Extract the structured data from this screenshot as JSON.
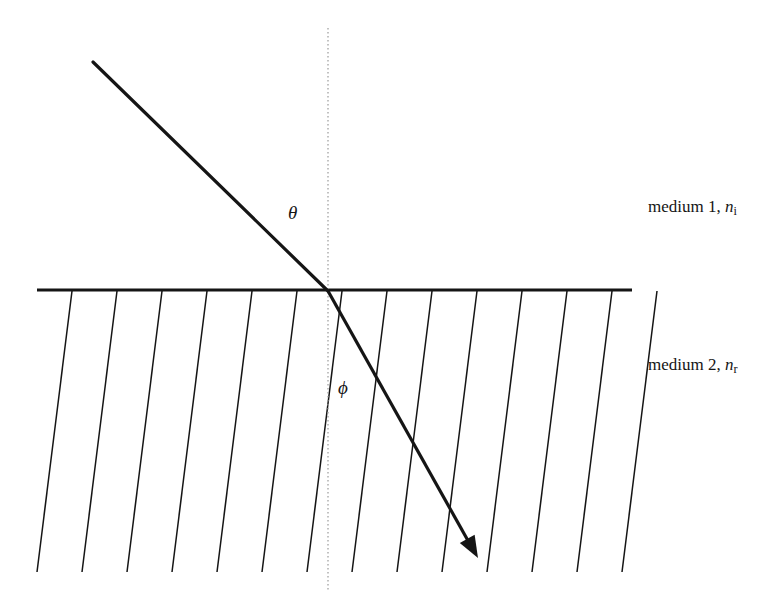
{
  "figure": {
    "kind": "optics-refraction-diagram",
    "background_color": "#ffffff",
    "stroke_color": "#151515",
    "width": 778,
    "height": 614
  },
  "labels": {
    "medium1": {
      "text": "medium 1, ",
      "symbol": "n",
      "subscript": "i",
      "full_text": "medium 1, n_i",
      "x": 648,
      "y": 198
    },
    "medium2": {
      "text": "medium 2, ",
      "symbol": "n",
      "subscript": "r",
      "full_text": "medium 2, n_r",
      "x": 648,
      "y": 356
    },
    "angle_incidence": {
      "symbol": "θ",
      "name": "theta",
      "x": 288,
      "y": 203
    },
    "angle_refraction": {
      "symbol": "ϕ",
      "name": "phi",
      "x": 338,
      "y": 378
    }
  },
  "geometry": {
    "interface": {
      "name": "boundary-line",
      "x1": 37,
      "y1": 290,
      "x2": 632,
      "y2": 290,
      "stroke_width": 3.2
    },
    "normal": {
      "name": "normal-dotted-line",
      "x": 328,
      "y1": 28,
      "y2": 590,
      "stroke_width": 1.2,
      "dash": "1.5 2.5",
      "color": "#9a9a9a"
    },
    "incident_ray": {
      "name": "incident-ray",
      "x1": 93,
      "y1": 62,
      "x2": 328,
      "y2": 291,
      "stroke_width": 3.2,
      "angle_from_normal_deg": 45.7
    },
    "refracted_ray": {
      "name": "refracted-ray",
      "x1": 328,
      "y1": 291,
      "x2": 471,
      "y2": 546,
      "stroke_width": 3.2,
      "angle_from_normal_deg": 29.3,
      "arrowhead": {
        "tip_x": 478,
        "tip_y": 558,
        "length": 22,
        "half_width": 8.5
      }
    },
    "hatching": {
      "name": "hatch-lines",
      "count": 14,
      "top_y": 291,
      "bottom_y": 572,
      "first_top_x": 72,
      "spacing_x": 45,
      "horizontal_shift": -35,
      "stroke_width": 1.5
    }
  },
  "chart_data": {
    "type": "diagram",
    "annotations": [
      "medium 1, n_i",
      "medium 2, n_r",
      "θ",
      "ϕ"
    ],
    "elements": [
      "incident ray",
      "refracted ray with arrowhead",
      "horizontal interface line",
      "vertical dotted normal",
      "hatched lower medium"
    ]
  }
}
